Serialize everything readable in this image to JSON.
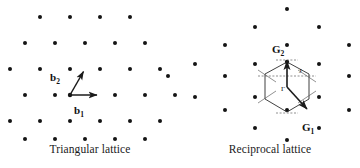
{
  "figure": {
    "type": "diagram",
    "background_color": "#ffffff",
    "dot_color": "#141414",
    "line_color": "#2b2b2b",
    "panels": [
      {
        "id": "triangular",
        "caption": "Triangular lattice",
        "origin": [
          70,
          95
        ],
        "lattice": {
          "type": "triangular",
          "orientation": "rows-horizontal",
          "spacing_px": 30,
          "row_height_px": 26,
          "row_offset_px": 15,
          "dot_radius_px": 2.0,
          "points": [
            [
              40,
              17
            ],
            [
              70,
              17
            ],
            [
              100,
              17
            ],
            [
              130,
              17
            ],
            [
              25,
              43
            ],
            [
              55,
              43
            ],
            [
              85,
              43
            ],
            [
              115,
              43
            ],
            [
              145,
              43
            ],
            [
              10,
              69
            ],
            [
              40,
              69
            ],
            [
              70,
              69
            ],
            [
              100,
              69
            ],
            [
              130,
              69
            ],
            [
              160,
              69
            ],
            [
              -5,
              95
            ],
            [
              25,
              95
            ],
            [
              55,
              95
            ],
            [
              70,
              95
            ],
            [
              85,
              95
            ],
            [
              115,
              95
            ],
            [
              145,
              95
            ],
            [
              175,
              95
            ],
            [
              10,
              121
            ],
            [
              40,
              121
            ],
            [
              70,
              121
            ],
            [
              100,
              121
            ],
            [
              130,
              121
            ],
            [
              160,
              121
            ],
            [
              25,
              139
            ],
            [
              55,
              139
            ],
            [
              85,
              139
            ],
            [
              115,
              139
            ],
            [
              145,
              139
            ]
          ]
        },
        "vectors": [
          {
            "name": "b1",
            "label": "b",
            "subscript": "1",
            "from": [
              70,
              95
            ],
            "to": [
              100,
              95
            ],
            "label_pos": [
              80,
              110
            ],
            "description": "primitive vector b1, horizontal to the right"
          },
          {
            "name": "b2",
            "label": "b",
            "subscript": "2",
            "from": [
              70,
              95
            ],
            "to": [
              85,
              69
            ],
            "label_pos": [
              57,
              78
            ],
            "description": "primitive vector b2, 60 degrees up-right"
          }
        ]
      },
      {
        "id": "reciprocal",
        "caption": "Reciprocal lattice",
        "origin": [
          107,
          87
        ],
        "lattice": {
          "type": "triangular-rotated-30",
          "orientation": "columns-vertical",
          "spacing_px": 37.5,
          "column_offset_px": 16,
          "dot_radius_px": 2.0,
          "points": [
            [
              107,
              9
            ],
            [
              75,
              27
            ],
            [
              139,
              27
            ],
            [
              45,
              45
            ],
            [
              107,
              45
            ],
            [
              169,
              45
            ],
            [
              15,
              64
            ],
            [
              75,
              64
            ],
            [
              139,
              64
            ],
            [
              196,
              64
            ],
            [
              45,
              76
            ],
            [
              107,
              76
            ],
            [
              169,
              76
            ],
            [
              -12,
              76
            ],
            [
              15,
              97
            ],
            [
              75,
              97
            ],
            [
              139,
              97
            ],
            [
              196,
              97
            ],
            [
              45,
              110
            ],
            [
              107,
              110
            ],
            [
              169,
              110
            ],
            [
              75,
              128
            ],
            [
              139,
              128
            ],
            [
              107,
              140
            ]
          ]
        },
        "brillouin_zone": {
          "shape": "hexagon",
          "center": [
            107,
            87
          ],
          "center_label": "Γ",
          "center_label_pos": [
            103,
            90
          ],
          "corner_label": "J",
          "corner_label_pos": [
            122,
            72
          ],
          "vertices": [
            [
              107,
              62
            ],
            [
              129,
              74
            ],
            [
              129,
              99
            ],
            [
              107,
              112
            ],
            [
              85,
              99
            ],
            [
              85,
              74
            ]
          ],
          "construction_lines": "perpendicular bisectors of nearest reciprocal lattice vectors"
        },
        "vectors": [
          {
            "name": "G1",
            "label": "G",
            "subscript": "1",
            "from": [
              107,
              87
            ],
            "to": [
              130,
              112
            ],
            "label_pos": [
              128,
              128
            ],
            "description": "reciprocal primitive vector G1, down-right"
          },
          {
            "name": "G2",
            "label": "G",
            "subscript": "2",
            "from": [
              107,
              87
            ],
            "to": [
              107,
              57
            ],
            "label_pos": [
              96,
              50
            ],
            "description": "reciprocal primitive vector G2, straight up"
          }
        ]
      }
    ]
  }
}
